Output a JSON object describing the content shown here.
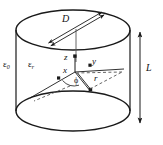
{
  "figure": {
    "background_color": "#ffffff",
    "line_color": "#1a1a1a",
    "dash_color": "#555555",
    "labels": {
      "eps0": "ε",
      "eps0_sub": "0",
      "epsr": "ε",
      "epsr_sub": "r",
      "diameter": "D",
      "length": "L",
      "axis_z": "z",
      "axis_y": "y",
      "axis_x": "x",
      "angle_phi": "ϕ",
      "radius_r": "r"
    },
    "geometry": {
      "cylinder": {
        "center_x": 73,
        "top_ellipse_cy": 30,
        "bottom_ellipse_cy": 111,
        "rx": 57,
        "ry": 20,
        "left_wall_x": 16,
        "right_wall_x": 130
      },
      "dimension_line_L": {
        "x": 140,
        "y_top": 32,
        "y_bottom": 123
      },
      "diameter_strip": {
        "x1": 47,
        "y1": 44,
        "x2": 101,
        "y2": 13
      },
      "origin": {
        "x": 75,
        "y": 72
      },
      "axis_z_tip": {
        "x": 75,
        "y": 52
      },
      "axis_y_tip": {
        "x": 97,
        "y": 65
      },
      "axis_x_tip": {
        "x": 40,
        "y": 92
      },
      "radius_point": {
        "x": 96,
        "y": 88
      }
    }
  }
}
